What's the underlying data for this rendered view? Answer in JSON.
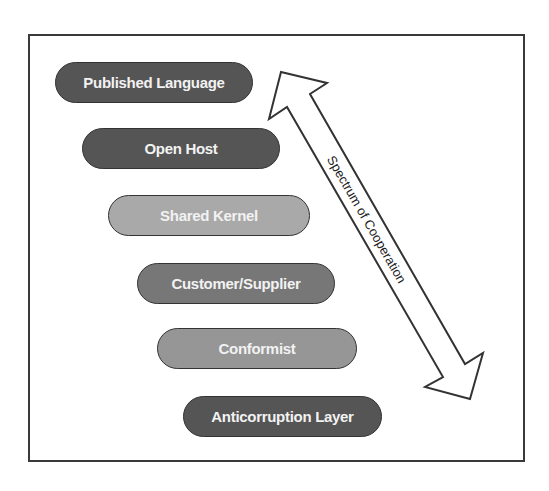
{
  "diagram": {
    "type": "context-mapping-patterns",
    "pills": [
      {
        "label": "Published Language",
        "color": "#555555",
        "x": 55,
        "y": 62,
        "w": 198
      },
      {
        "label": "Open Host",
        "color": "#555555",
        "x": 82,
        "y": 128,
        "w": 198
      },
      {
        "label": "Shared Kernel",
        "color": "#a9a9a9",
        "x": 108,
        "y": 195,
        "w": 202
      },
      {
        "label": "Customer/Supplier",
        "color": "#777777",
        "x": 137,
        "y": 263,
        "w": 198
      },
      {
        "label": "Conformist",
        "color": "#969696",
        "x": 157,
        "y": 328,
        "w": 200
      },
      {
        "label": "Anticorruption Layer",
        "color": "#555555",
        "x": 183,
        "y": 396,
        "w": 199
      }
    ],
    "arrow": {
      "label": "Spectrum of Cooperation",
      "direction": "bidirectional"
    }
  }
}
